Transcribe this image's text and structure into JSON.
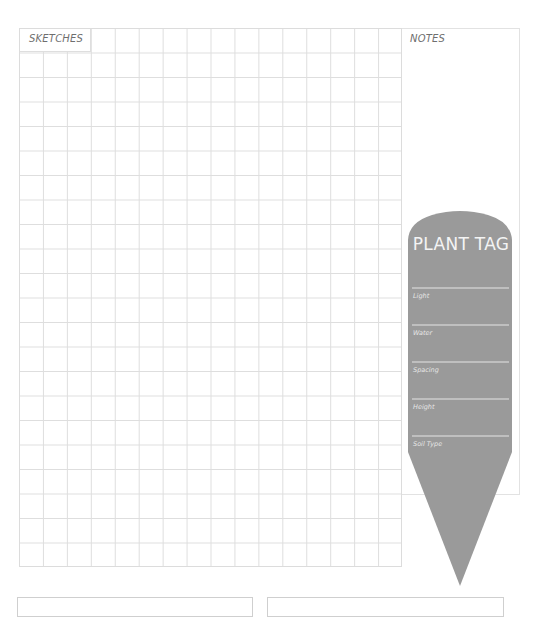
{
  "sketches": {
    "label": "SKETCHES",
    "grid": {
      "columns": 16,
      "rows": 22,
      "line_color": "#dedede"
    }
  },
  "notes": {
    "label": "NOTES"
  },
  "plant_tag": {
    "title": "PLANT TAG",
    "fill_color": "#9a9a9a",
    "fields": [
      {
        "label": "Light"
      },
      {
        "label": "Water"
      },
      {
        "label": "Spacing"
      },
      {
        "label": "Height"
      },
      {
        "label": "Soil Type"
      }
    ]
  }
}
